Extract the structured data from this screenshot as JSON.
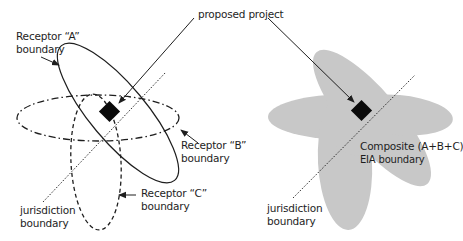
{
  "diagram": {
    "title_label": "proposed project",
    "left": {
      "receptor_a": {
        "line1": "Receptor “A”",
        "line2": "boundary",
        "style": "solid"
      },
      "receptor_b": {
        "line1": "Receptor “B”",
        "line2": "boundary",
        "style": "dash-dot"
      },
      "receptor_c": {
        "line1": "Receptor “C”",
        "line2": "boundary",
        "style": "dashed"
      },
      "jurisdiction": {
        "line1": "jurisdiction",
        "line2": "boundary",
        "style": "dotted"
      },
      "project_marker": "filled-diamond"
    },
    "right": {
      "composite": {
        "line1": "Composite (A+B+C)",
        "line2": "EIA boundary"
      },
      "jurisdiction": {
        "line1": "jurisdiction",
        "line2": "boundary",
        "style": "dotted"
      },
      "fill_color": "#c8c8c8",
      "project_marker": "filled-diamond"
    },
    "colors": {
      "line": "#1e1e1e",
      "composite_fill": "#c8c8c8",
      "background": "#ffffff"
    }
  }
}
